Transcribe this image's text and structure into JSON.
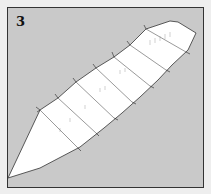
{
  "figure": {
    "label": "3",
    "colors": {
      "background": "#eeeeee",
      "panel": "#c9c9c9",
      "body": "#ffffff",
      "outline": "#333333"
    }
  }
}
